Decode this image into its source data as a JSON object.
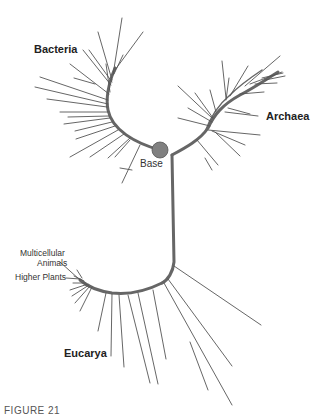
{
  "diagram": {
    "type": "unrooted phylogenetic tree",
    "labels": {
      "bacteria": "Bacteria",
      "archaea": "Archaea",
      "eucarya": "Eucarya",
      "base": "Base",
      "multicellular_animals_line1": "Multicellular",
      "multicellular_animals_line2": "Animals",
      "higher_plants": "Higher Plants"
    },
    "caption": "FIGURE 21",
    "colors": {
      "branch": "#555555",
      "trunk": "#666666",
      "base_node": "#808080",
      "text": "#222222"
    }
  }
}
